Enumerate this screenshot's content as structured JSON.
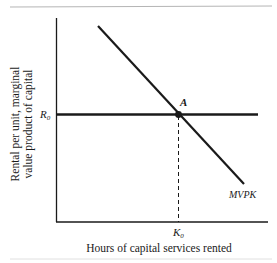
{
  "figure": {
    "y_axis_label_line1": "Rental per unit, marginal",
    "y_axis_label_line2": "value product of capital",
    "x_axis_label": "Hours of capital services rented",
    "y_tick_label": "R",
    "y_tick_sub": "0",
    "x_tick_label": "K",
    "x_tick_sub": "0",
    "point_label": "A",
    "curve_label": "MVPK"
  },
  "colors": {
    "ink": "#1a1a1a",
    "rule": "#b0b0b0"
  }
}
